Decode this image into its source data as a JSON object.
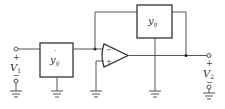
{
  "diagram": {
    "type": "circuit",
    "input": {
      "label": "V",
      "subscript": "1",
      "plus": "+",
      "minus": "−"
    },
    "output": {
      "label": "V",
      "subscript": "2",
      "plus": "+",
      "minus": "−"
    },
    "input_block": {
      "label": "y",
      "subscript": "ij",
      "prime": "′"
    },
    "feedback_block": {
      "label": "y",
      "subscript": "ij"
    },
    "opamp": {
      "inverting": "−",
      "noninverting": "+"
    }
  }
}
